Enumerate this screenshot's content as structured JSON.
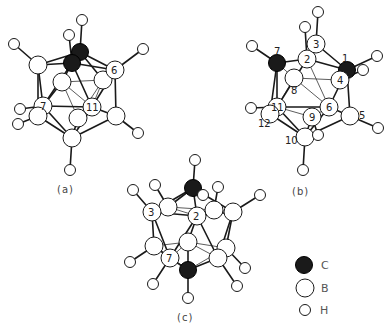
{
  "figure": {
    "panels": [
      {
        "id": "a",
        "caption": "(a)",
        "atom_labels": [
          "6",
          "7",
          "11"
        ]
      },
      {
        "id": "b",
        "caption": "(b)",
        "atom_labels": [
          "1",
          "2",
          "3",
          "4",
          "5",
          "6",
          "7",
          "8",
          "9",
          "10",
          "11",
          "12"
        ]
      },
      {
        "id": "c",
        "caption": "(c)",
        "atom_labels": [
          "2",
          "3",
          "7"
        ]
      }
    ],
    "legend": [
      {
        "element": "C",
        "label": "C",
        "style": "filled-large"
      },
      {
        "element": "B",
        "label": "B",
        "style": "open-large"
      },
      {
        "element": "H",
        "label": "H",
        "style": "open-small"
      }
    ]
  },
  "text": {
    "caption_a": "(a)",
    "caption_b": "(b)",
    "caption_c": "(c)",
    "legend_c": "C",
    "legend_b": "B",
    "legend_h": "H",
    "a_6": "6",
    "a_7": "7",
    "a_11": "11",
    "b_1": "1",
    "b_2": "2",
    "b_3": "3",
    "b_4": "4",
    "b_5": "5",
    "b_6": "6",
    "b_7": "7",
    "b_8": "8",
    "b_9": "9",
    "b_10": "10",
    "b_11": "11",
    "b_12": "12",
    "c_2": "2",
    "c_3": "3",
    "c_7": "7"
  },
  "colors": {
    "carbon": "#1a1a1a",
    "boron": "#ffffff",
    "hydrogen": "#ffffff",
    "bond": "#1a1a1a"
  }
}
